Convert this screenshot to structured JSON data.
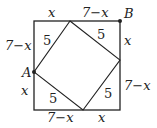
{
  "diagram": {
    "points": {
      "A": "A",
      "B": "B"
    },
    "labels": {
      "top_left": "x",
      "top_right": "7−x",
      "right_top": "x",
      "right_bottom": "7−x",
      "bottom_right": "x",
      "bottom_left": "7−x",
      "left_bottom": "x",
      "left_top": "7−x",
      "hyp_top_left": "5",
      "hyp_top_right": "5",
      "hyp_bottom_right": "5",
      "hyp_bottom_left": "5"
    },
    "colors": {
      "stroke": "#222222"
    }
  }
}
